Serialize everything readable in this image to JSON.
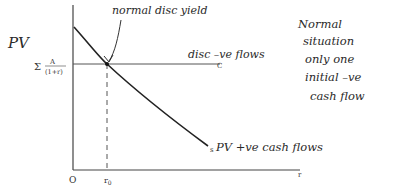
{
  "diagram": {
    "y_axis_label": "PV",
    "x_axis_label": "r",
    "origin_label": "O",
    "r0_label": "r0",
    "r0_sub": "0",
    "pv_level_label_sum": "Σ",
    "pv_level_label_num": "A",
    "pv_level_label_num_sub": "i",
    "pv_level_label_den": "(1+r)",
    "pv_level_label_den_sup": "i",
    "annotation_intersection": "normal disc yield",
    "horizontal_line_label": "disc –ve flows",
    "horizontal_line_end_label": "C",
    "curve_label": "PV +ve cash flows",
    "curve_end_label": "s",
    "side_note": [
      "Normal",
      "situation",
      "only one",
      "initial –ve",
      "cash flow"
    ],
    "colors": {
      "ink": "#2a2a2a",
      "axis": "#444444",
      "background": "#ffffff"
    }
  }
}
